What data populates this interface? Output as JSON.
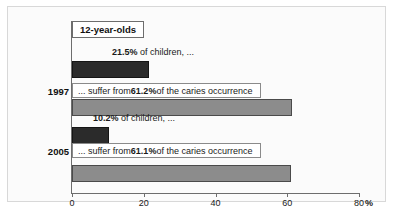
{
  "chart_data": {
    "type": "bar",
    "title": "",
    "legend": "12-year-olds",
    "legend_position": "top-left-inside",
    "orientation": "horizontal",
    "xlabel": "%",
    "ylabel": "",
    "xlim": [
      0,
      80
    ],
    "xticks": [
      0,
      20,
      40,
      60,
      80
    ],
    "xtick_labels": [
      "0",
      "20",
      "40",
      "60",
      "80"
    ],
    "grid": false,
    "categories": [
      "1997",
      "2005"
    ],
    "series": [
      {
        "name": "share of children",
        "color": "#2b2b2b",
        "values": [
          21.5,
          10.2
        ]
      },
      {
        "name": "share of caries occurrence",
        "color": "#8c8c8c",
        "values": [
          61.2,
          61.1
        ]
      }
    ],
    "annotations": [
      {
        "group": "1997",
        "series": "share of children",
        "value": 21.5,
        "prefix": "",
        "value_text": "21.5%",
        "suffix": " of children, ..."
      },
      {
        "group": "1997",
        "series": "share of caries occurrence",
        "value": 61.2,
        "prefix": "... suffer from ",
        "value_text": "61.2%",
        "suffix": " of the caries occurrence"
      },
      {
        "group": "2005",
        "series": "share of children",
        "value": 10.2,
        "prefix": "",
        "value_text": "10.2%",
        "suffix": " of children, ..."
      },
      {
        "group": "2005",
        "series": "share of caries occurrence",
        "value": 61.1,
        "prefix": "... suffer from ",
        "value_text": "61.1%",
        "suffix": " of the caries occurrence"
      }
    ]
  },
  "axis": {
    "percent_symbol": "%"
  },
  "colors": {
    "bar_dark": "#2b2b2b",
    "bar_grey": "#8c8c8c",
    "axis": "#6d6d6d",
    "frame": "#d8d8d8",
    "background": "#fbfbfb"
  }
}
